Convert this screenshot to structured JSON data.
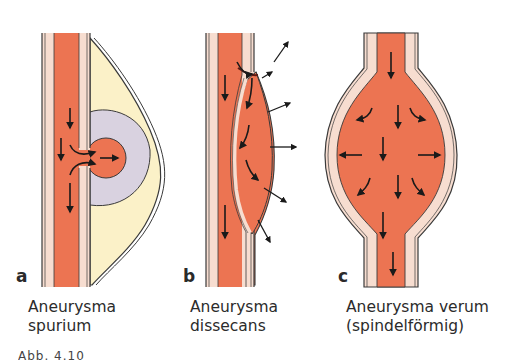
{
  "figure": {
    "panels": [
      {
        "letter": "a",
        "caption_line1": "Aneurysma",
        "caption_line2": "spurium"
      },
      {
        "letter": "b",
        "caption_line1": "Aneurysma",
        "caption_line2": "dissecans"
      },
      {
        "letter": "c",
        "caption_line1": "Aneurysma verum",
        "caption_line2": "(spindelförmig)"
      }
    ],
    "cutoff_caption": "Abb. 4.10"
  },
  "colors": {
    "blood": "#ec7452",
    "vessel_wall": "#f7ddd0",
    "wall_outline": "#3a3a3a",
    "hematoma_outer": "#fbf1c8",
    "hematoma_inner": "#d9d2e0",
    "arrow": "#1a1a1a"
  }
}
